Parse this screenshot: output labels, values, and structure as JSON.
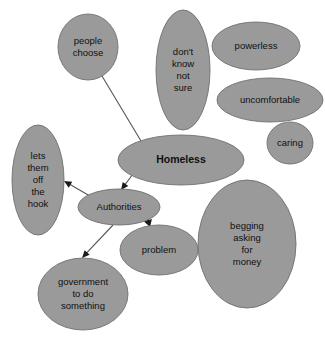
{
  "diagram": {
    "title": "Homeless",
    "type": "concept-map",
    "canvas": {
      "width": 325,
      "height": 347
    },
    "style": {
      "background_color": "#ffffff",
      "node_fill_color": "#9a9a9a",
      "node_stroke_color": "#6f6f6f",
      "text_color": "#101010",
      "edge_color": "#555555",
      "arrow_color": "#1a1a1a"
    },
    "nodes": [
      {
        "id": "people-choose",
        "label": "people choose",
        "lines": [
          "people",
          "choose"
        ],
        "cx": 88,
        "cy": 47,
        "rx": 30,
        "ry": 33,
        "font_size": 9.5,
        "bold": false
      },
      {
        "id": "dont-know-not-sure",
        "label": "don't know not sure",
        "lines": [
          "don't",
          "know",
          "not",
          "sure"
        ],
        "cx": 183,
        "cy": 70,
        "rx": 27,
        "ry": 60,
        "font_size": 9.5,
        "bold": false
      },
      {
        "id": "powerless",
        "label": "powerless",
        "lines": [
          "powerless"
        ],
        "cx": 256,
        "cy": 46,
        "rx": 44,
        "ry": 24,
        "font_size": 9.5,
        "bold": false
      },
      {
        "id": "uncomfortable",
        "label": "uncomfortable",
        "lines": [
          "uncomfortable"
        ],
        "cx": 270,
        "cy": 100,
        "rx": 53,
        "ry": 22,
        "font_size": 9.5,
        "bold": false
      },
      {
        "id": "caring",
        "label": "caring",
        "lines": [
          "caring"
        ],
        "cx": 290,
        "cy": 143,
        "rx": 23,
        "ry": 21,
        "font_size": 9.5,
        "bold": false
      },
      {
        "id": "homeless",
        "label": "Homeless",
        "lines": [
          "Homeless"
        ],
        "cx": 181,
        "cy": 160,
        "rx": 63,
        "ry": 25,
        "font_size": 10.5,
        "bold": true
      },
      {
        "id": "lets-them-off-the-hook",
        "label": "lets them off the hook",
        "lines": [
          "lets",
          "them",
          "off",
          "the",
          "hook"
        ],
        "cx": 38,
        "cy": 180,
        "rx": 26,
        "ry": 55,
        "font_size": 9.5,
        "bold": false
      },
      {
        "id": "authorities",
        "label": "Authorities",
        "lines": [
          "Authorities"
        ],
        "cx": 119,
        "cy": 207,
        "rx": 41,
        "ry": 18,
        "font_size": 9.5,
        "bold": false
      },
      {
        "id": "problem",
        "label": "problem",
        "lines": [
          "problem"
        ],
        "cx": 159,
        "cy": 250,
        "rx": 39,
        "ry": 25,
        "font_size": 9.5,
        "bold": false
      },
      {
        "id": "begging-asking-for-money",
        "label": "begging asking for money",
        "lines": [
          "begging",
          "asking",
          "for",
          "money"
        ],
        "cx": 247,
        "cy": 244,
        "rx": 49,
        "ry": 64,
        "font_size": 9.5,
        "bold": false
      },
      {
        "id": "government-to-do-something",
        "label": "government to do something",
        "lines": [
          "government",
          "to do",
          "something"
        ],
        "cx": 83,
        "cy": 294,
        "rx": 45,
        "ry": 36,
        "font_size": 9.5,
        "bold": false
      }
    ],
    "edges": [
      {
        "id": "people-choose-to-homeless",
        "from": "people choose",
        "to": "Homeless",
        "x1": 102,
        "y1": 76,
        "x2": 144,
        "y2": 146,
        "arrow": false,
        "thick": false
      },
      {
        "id": "homeless-to-authorities",
        "from": "Homeless",
        "to": "Authorities",
        "x1": 133,
        "y1": 174,
        "x2": 121,
        "y2": 190,
        "arrow": true,
        "thick": false
      },
      {
        "id": "authorities-to-lets-them-off-the-hook",
        "from": "Authorities",
        "to": "lets them off the hook",
        "x1": 95,
        "y1": 199,
        "x2": 64,
        "y2": 181,
        "arrow": true,
        "thick": false
      },
      {
        "id": "authorities-to-problem",
        "from": "Authorities",
        "to": "problem",
        "x1": 146,
        "y1": 214,
        "x2": 150,
        "y2": 227,
        "arrow": true,
        "thick": true
      },
      {
        "id": "authorities-to-government-to-do-something",
        "from": "Authorities",
        "to": "government to do something",
        "x1": 113,
        "y1": 225,
        "x2": 82,
        "y2": 258,
        "arrow": true,
        "thick": false
      }
    ]
  }
}
